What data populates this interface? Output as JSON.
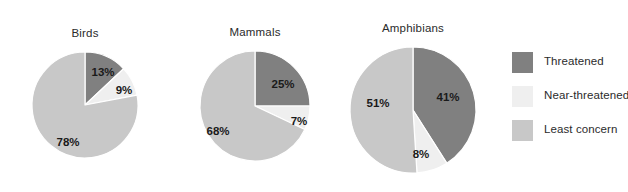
{
  "chart_data": {
    "type": "pie",
    "title": "",
    "grid": false,
    "legend_position": "right",
    "categories": [
      "Threatened",
      "Near-threatened",
      "Least concern"
    ],
    "colors": {
      "Threatened": "#808080",
      "Near-threatened": "#efefef",
      "Least concern": "#c8c8c8",
      "slice_border": "#ffffff",
      "text": "#2b2b2b"
    },
    "units": "percent",
    "charts": [
      {
        "title": "Birds",
        "center": [
          85,
          105
        ],
        "radius": 53,
        "slices": [
          {
            "label": "Threatened",
            "value": 13,
            "value_label": "13%",
            "label_x": 103,
            "label_y": 73
          },
          {
            "label": "Near-threatened",
            "value": 9,
            "value_label": "9%",
            "label_x": 124,
            "label_y": 91
          },
          {
            "label": "Least concern",
            "value": 78,
            "value_label": "78%",
            "label_x": 68,
            "label_y": 143
          }
        ]
      },
      {
        "title": "Mammals",
        "center": [
          255,
          106
        ],
        "radius": 55,
        "slices": [
          {
            "label": "Threatened",
            "value": 25,
            "value_label": "25%",
            "label_x": 283,
            "label_y": 85
          },
          {
            "label": "Near-threatened",
            "value": 7,
            "value_label": "7%",
            "label_x": 299,
            "label_y": 122
          },
          {
            "label": "Least concern",
            "value": 68,
            "value_label": "68%",
            "label_x": 218,
            "label_y": 132
          }
        ]
      },
      {
        "title": "Amphibians",
        "center": [
          413,
          110
        ],
        "radius": 63,
        "slices": [
          {
            "label": "Threatened",
            "value": 41,
            "value_label": "41%",
            "label_x": 448,
            "label_y": 98
          },
          {
            "label": "Near-threatened",
            "value": 8,
            "value_label": "8%",
            "label_x": 421,
            "label_y": 155
          },
          {
            "label": "Least concern",
            "value": 51,
            "value_label": "51%",
            "label_x": 378,
            "label_y": 104
          }
        ]
      }
    ],
    "legend": [
      {
        "label": "Threatened",
        "color": "#808080"
      },
      {
        "label": "Near-threatened",
        "color": "#efefef"
      },
      {
        "label": "Least concern",
        "color": "#c8c8c8"
      }
    ]
  }
}
